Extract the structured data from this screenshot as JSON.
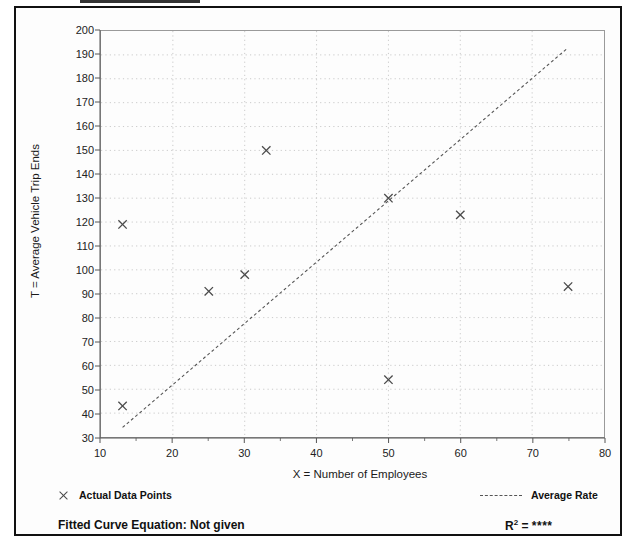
{
  "page": {
    "background_color": "#ffffff",
    "frame_color": "#111111"
  },
  "chart_data": {
    "type": "scatter",
    "title": "",
    "xlabel": "X = Number of Employees",
    "ylabel": "T = Average Vehicle Trip Ends",
    "xlim": [
      10,
      80
    ],
    "ylim": [
      30,
      200
    ],
    "xticks": [
      10,
      20,
      30,
      40,
      50,
      60,
      70,
      80
    ],
    "yticks": [
      30,
      40,
      50,
      60,
      70,
      80,
      90,
      100,
      110,
      120,
      130,
      140,
      150,
      160,
      170,
      180,
      190,
      200
    ],
    "xtick_labels": [
      "10",
      "20",
      "30",
      "40",
      "50",
      "60",
      "70",
      "80"
    ],
    "ytick_labels": [
      "30",
      "40",
      "50",
      "60",
      "70",
      "80",
      "90",
      "100",
      "110",
      "120",
      "130",
      "140",
      "150",
      "160",
      "170",
      "180",
      "190",
      "200"
    ],
    "grid": true,
    "grid_style": "dotted",
    "legend_position": "below-plot",
    "series": [
      {
        "name": "Actual Data Points",
        "type": "scatter",
        "marker": "x",
        "color": "#4a4a4a",
        "points": [
          {
            "x": 13,
            "y": 119
          },
          {
            "x": 13,
            "y": 43
          },
          {
            "x": 25,
            "y": 91
          },
          {
            "x": 30,
            "y": 98
          },
          {
            "x": 33,
            "y": 150
          },
          {
            "x": 50,
            "y": 130
          },
          {
            "x": 50,
            "y": 54
          },
          {
            "x": 60,
            "y": 123
          },
          {
            "x": 75,
            "y": 93
          }
        ]
      },
      {
        "name": "Average Rate",
        "type": "line",
        "style": "dashed",
        "color": "#555555",
        "x": [
          13,
          75
        ],
        "y": [
          34,
          193
        ]
      }
    ]
  },
  "axis_titles": {
    "x": "X = Number of Employees",
    "y": "T = Average Vehicle Trip Ends"
  },
  "legend": {
    "data_points_label": "Actual Data Points",
    "data_points_marker": "x-marker-icon",
    "average_rate_label": "Average Rate",
    "average_rate_marker": "dashed-line-icon"
  },
  "footer": {
    "fitted_curve_label": "Fitted Curve Equation:  Not given",
    "r_squared_prefix": "R",
    "r_squared_exponent": "2",
    "r_squared_equals": " = ",
    "r_squared_value": "****"
  }
}
